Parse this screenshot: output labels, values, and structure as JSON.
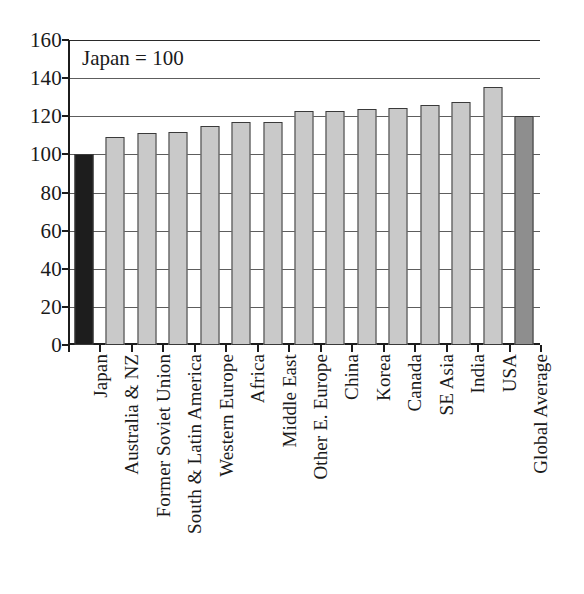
{
  "chart_data": {
    "type": "bar",
    "title": "",
    "subtitle": "",
    "annotation": "Japan = 100",
    "xlabel": "",
    "ylabel": "",
    "ylim": [
      0,
      160
    ],
    "y_ticks": [
      0,
      20,
      40,
      60,
      80,
      100,
      120,
      140,
      160
    ],
    "grid": true,
    "legend": "none",
    "categories": [
      "Japan",
      "Australia & NZ",
      "Former Soviet Union",
      "South & Latin America",
      "Western Europe",
      "Africa",
      "Middle East",
      "Other E. Europe",
      "China",
      "Korea",
      "Canada",
      "SE Asia",
      "India",
      "USA",
      "Global Average"
    ],
    "values": [
      100,
      109,
      111,
      112,
      115,
      117,
      117,
      122.5,
      123,
      124,
      124.5,
      126,
      127.5,
      135.5,
      120
    ],
    "bar_colors": [
      "#1d1d1d",
      "#c9c9c9",
      "#c9c9c9",
      "#c9c9c9",
      "#c9c9c9",
      "#c9c9c9",
      "#c9c9c9",
      "#c9c9c9",
      "#c9c9c9",
      "#c9c9c9",
      "#c9c9c9",
      "#c9c9c9",
      "#c9c9c9",
      "#c9c9c9",
      "#8e8e8e"
    ]
  },
  "colors": {
    "axis": "#1c1c1c",
    "gridline": "#5d5d5d",
    "background": "#ffffff",
    "bar_highlight": "#1d1d1d",
    "bar_default": "#c9c9c9",
    "bar_average": "#8e8e8e"
  }
}
